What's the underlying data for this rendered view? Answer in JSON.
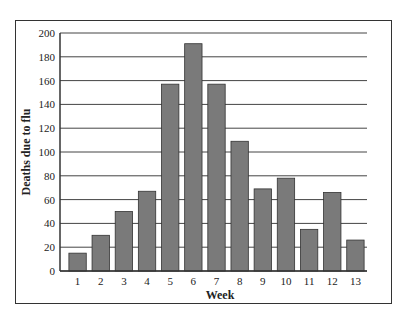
{
  "chart_data": {
    "type": "bar",
    "title": "",
    "xlabel": "Week",
    "ylabel": "Deaths due to flu",
    "categories": [
      "1",
      "2",
      "3",
      "4",
      "5",
      "6",
      "7",
      "8",
      "9",
      "10",
      "11",
      "12",
      "13"
    ],
    "values": [
      15,
      30,
      50,
      67,
      157,
      191,
      157,
      109,
      69,
      78,
      35,
      66,
      26
    ],
    "ylim": [
      0,
      200
    ],
    "yticks": [
      0,
      20,
      40,
      60,
      80,
      100,
      120,
      140,
      160,
      180,
      200
    ],
    "grid": true,
    "legend": null,
    "bar_color": "#7a7a7a"
  }
}
